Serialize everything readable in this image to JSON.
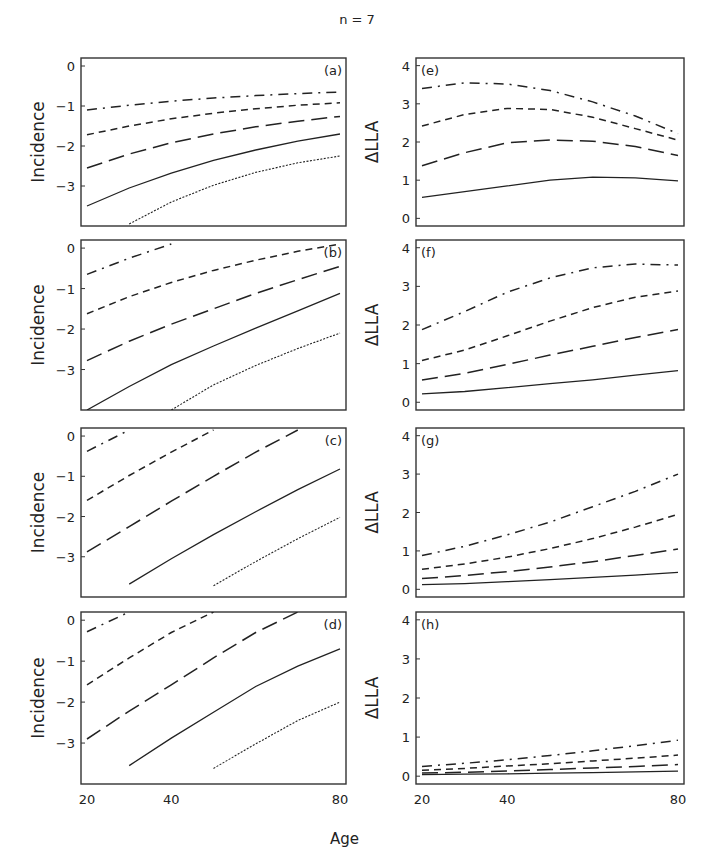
{
  "figure": {
    "title": "n = 7",
    "xlabel": "Age",
    "left_ylabel": "Incidence",
    "right_ylabel": "ΔLLA",
    "x_ticks": [
      "20",
      "40",
      "80"
    ],
    "left_y_ticks": [
      "0",
      "−1",
      "−2",
      "−3"
    ],
    "right_y_ticks": [
      "0",
      "1",
      "2",
      "3",
      "4"
    ]
  },
  "chart_data": [
    {
      "type": "line",
      "panel": "(a)",
      "title": "(a)",
      "xlabel": "",
      "ylabel": "Incidence",
      "xlim": [
        20,
        80
      ],
      "ylim": [
        -4,
        0.2
      ],
      "x": [
        20,
        30,
        40,
        50,
        60,
        70,
        80
      ],
      "series": [
        {
          "name": "dash-dot",
          "style": "dashdot",
          "values": [
            -1.1,
            -0.98,
            -0.88,
            -0.8,
            -0.74,
            -0.69,
            -0.65
          ]
        },
        {
          "name": "short-dash",
          "style": "shortdash",
          "values": [
            -1.72,
            -1.5,
            -1.32,
            -1.18,
            -1.07,
            -0.98,
            -0.92
          ]
        },
        {
          "name": "long-dash",
          "style": "longdash",
          "values": [
            -2.55,
            -2.2,
            -1.92,
            -1.7,
            -1.52,
            -1.38,
            -1.26
          ]
        },
        {
          "name": "solid",
          "style": "solid",
          "values": [
            -3.5,
            -3.05,
            -2.68,
            -2.36,
            -2.1,
            -1.88,
            -1.7
          ]
        },
        {
          "name": "dotted",
          "style": "dotted",
          "values": [
            null,
            -3.95,
            -3.4,
            -2.98,
            -2.66,
            -2.42,
            -2.25
          ]
        }
      ]
    },
    {
      "type": "line",
      "panel": "(b)",
      "title": "(b)",
      "xlabel": "",
      "ylabel": "Incidence",
      "xlim": [
        20,
        80
      ],
      "ylim": [
        -4,
        0.2
      ],
      "x": [
        20,
        30,
        40,
        50,
        60,
        70,
        80
      ],
      "series": [
        {
          "name": "dash-dot",
          "style": "dashdot",
          "values": [
            -0.65,
            -0.25,
            0.1,
            null,
            null,
            null,
            null
          ]
        },
        {
          "name": "short-dash",
          "style": "shortdash",
          "values": [
            -1.62,
            -1.2,
            -0.85,
            -0.55,
            -0.3,
            -0.08,
            0.1
          ]
        },
        {
          "name": "long-dash",
          "style": "longdash",
          "values": [
            -2.78,
            -2.3,
            -1.88,
            -1.5,
            -1.12,
            -0.78,
            -0.45
          ]
        },
        {
          "name": "solid",
          "style": "solid",
          "values": [
            -4.0,
            -3.42,
            -2.88,
            -2.42,
            -1.98,
            -1.55,
            -1.12
          ]
        },
        {
          "name": "dotted",
          "style": "dotted",
          "values": [
            null,
            null,
            -4.0,
            -3.38,
            -2.9,
            -2.48,
            -2.1
          ]
        }
      ]
    },
    {
      "type": "line",
      "panel": "(c)",
      "title": "(c)",
      "xlabel": "",
      "ylabel": "Incidence",
      "xlim": [
        20,
        80
      ],
      "ylim": [
        -4,
        0.2
      ],
      "x": [
        20,
        30,
        40,
        50,
        60,
        70,
        80
      ],
      "series": [
        {
          "name": "dash-dot",
          "style": "dashdot",
          "values": [
            -0.38,
            0.15,
            null,
            null,
            null,
            null,
            null
          ]
        },
        {
          "name": "short-dash",
          "style": "shortdash",
          "values": [
            -1.6,
            -0.98,
            -0.4,
            0.15,
            null,
            null,
            null
          ]
        },
        {
          "name": "long-dash",
          "style": "longdash",
          "values": [
            -2.88,
            -2.25,
            -1.62,
            -1.0,
            -0.4,
            0.15,
            null
          ]
        },
        {
          "name": "solid",
          "style": "solid",
          "values": [
            null,
            -3.68,
            -3.05,
            -2.45,
            -1.88,
            -1.33,
            -0.82
          ]
        },
        {
          "name": "dotted",
          "style": "dotted",
          "values": [
            null,
            null,
            null,
            -3.72,
            -3.12,
            -2.55,
            -2.02
          ]
        }
      ]
    },
    {
      "type": "line",
      "panel": "(d)",
      "title": "(d)",
      "xlabel": "Age",
      "ylabel": "Incidence",
      "xlim": [
        20,
        80
      ],
      "ylim": [
        -4,
        0.2
      ],
      "x": [
        20,
        30,
        40,
        50,
        60,
        70,
        80
      ],
      "series": [
        {
          "name": "dash-dot",
          "style": "dashdot",
          "values": [
            -0.28,
            0.2,
            null,
            null,
            null,
            null,
            null
          ]
        },
        {
          "name": "short-dash",
          "style": "shortdash",
          "values": [
            -1.58,
            -0.92,
            -0.3,
            0.2,
            null,
            null,
            null
          ]
        },
        {
          "name": "long-dash",
          "style": "longdash",
          "values": [
            -2.9,
            -2.22,
            -1.58,
            -0.92,
            -0.3,
            0.2,
            null
          ]
        },
        {
          "name": "solid",
          "style": "solid",
          "values": [
            null,
            -3.55,
            -2.88,
            -2.25,
            -1.62,
            -1.12,
            -0.7
          ]
        },
        {
          "name": "dotted",
          "style": "dotted",
          "values": [
            null,
            null,
            null,
            -3.62,
            -3.02,
            -2.45,
            -2.0
          ]
        }
      ]
    },
    {
      "type": "line",
      "panel": "(e)",
      "title": "(e)",
      "xlabel": "",
      "ylabel": "ΔLLA",
      "xlim": [
        20,
        80
      ],
      "ylim": [
        -0.2,
        4.2
      ],
      "x": [
        20,
        30,
        40,
        50,
        60,
        70,
        80
      ],
      "series": [
        {
          "name": "dash-dot",
          "style": "dashdot",
          "values": [
            3.4,
            3.55,
            3.52,
            3.35,
            3.05,
            2.68,
            2.22
          ]
        },
        {
          "name": "short-dash",
          "style": "shortdash",
          "values": [
            2.42,
            2.72,
            2.88,
            2.85,
            2.65,
            2.35,
            2.05
          ]
        },
        {
          "name": "long-dash",
          "style": "longdash",
          "values": [
            1.38,
            1.72,
            1.98,
            2.05,
            2.02,
            1.88,
            1.65
          ]
        },
        {
          "name": "solid",
          "style": "solid",
          "values": [
            0.55,
            0.7,
            0.85,
            1.0,
            1.08,
            1.06,
            0.98
          ]
        }
      ]
    },
    {
      "type": "line",
      "panel": "(f)",
      "title": "(f)",
      "xlabel": "",
      "ylabel": "ΔLLA",
      "xlim": [
        20,
        80
      ],
      "ylim": [
        -0.2,
        4.2
      ],
      "x": [
        20,
        30,
        40,
        50,
        60,
        70,
        80
      ],
      "series": [
        {
          "name": "dash-dot",
          "style": "dashdot",
          "values": [
            1.88,
            2.35,
            2.85,
            3.22,
            3.48,
            3.58,
            3.55
          ]
        },
        {
          "name": "short-dash",
          "style": "shortdash",
          "values": [
            1.08,
            1.35,
            1.72,
            2.1,
            2.45,
            2.72,
            2.88
          ]
        },
        {
          "name": "long-dash",
          "style": "longdash",
          "values": [
            0.58,
            0.75,
            0.98,
            1.22,
            1.45,
            1.68,
            1.88
          ]
        },
        {
          "name": "solid",
          "style": "solid",
          "values": [
            0.22,
            0.28,
            0.38,
            0.48,
            0.58,
            0.7,
            0.82
          ]
        }
      ]
    },
    {
      "type": "line",
      "panel": "(g)",
      "title": "(g)",
      "xlabel": "",
      "ylabel": "ΔLLA",
      "xlim": [
        20,
        80
      ],
      "ylim": [
        -0.2,
        4.2
      ],
      "x": [
        20,
        30,
        40,
        50,
        60,
        70,
        80
      ],
      "series": [
        {
          "name": "dash-dot",
          "style": "dashdot",
          "values": [
            0.88,
            1.12,
            1.42,
            1.75,
            2.15,
            2.55,
            3.0
          ]
        },
        {
          "name": "short-dash",
          "style": "shortdash",
          "values": [
            0.52,
            0.66,
            0.84,
            1.06,
            1.32,
            1.62,
            1.95
          ]
        },
        {
          "name": "long-dash",
          "style": "longdash",
          "values": [
            0.28,
            0.36,
            0.46,
            0.58,
            0.72,
            0.88,
            1.05
          ]
        },
        {
          "name": "solid",
          "style": "solid",
          "values": [
            0.12,
            0.15,
            0.2,
            0.25,
            0.31,
            0.37,
            0.44
          ]
        }
      ]
    },
    {
      "type": "line",
      "panel": "(h)",
      "title": "(h)",
      "xlabel": "Age",
      "ylabel": "ΔLLA",
      "xlim": [
        20,
        80
      ],
      "ylim": [
        -0.2,
        4.2
      ],
      "x": [
        20,
        30,
        40,
        50,
        60,
        70,
        80
      ],
      "series": [
        {
          "name": "dash-dot",
          "style": "dashdot",
          "values": [
            0.25,
            0.33,
            0.42,
            0.53,
            0.65,
            0.78,
            0.92
          ]
        },
        {
          "name": "short-dash",
          "style": "shortdash",
          "values": [
            0.15,
            0.2,
            0.26,
            0.32,
            0.39,
            0.46,
            0.54
          ]
        },
        {
          "name": "long-dash",
          "style": "longdash",
          "values": [
            0.08,
            0.1,
            0.13,
            0.17,
            0.21,
            0.25,
            0.3
          ]
        },
        {
          "name": "solid",
          "style": "solid",
          "values": [
            0.04,
            0.05,
            0.06,
            0.08,
            0.09,
            0.11,
            0.13
          ]
        }
      ]
    }
  ]
}
